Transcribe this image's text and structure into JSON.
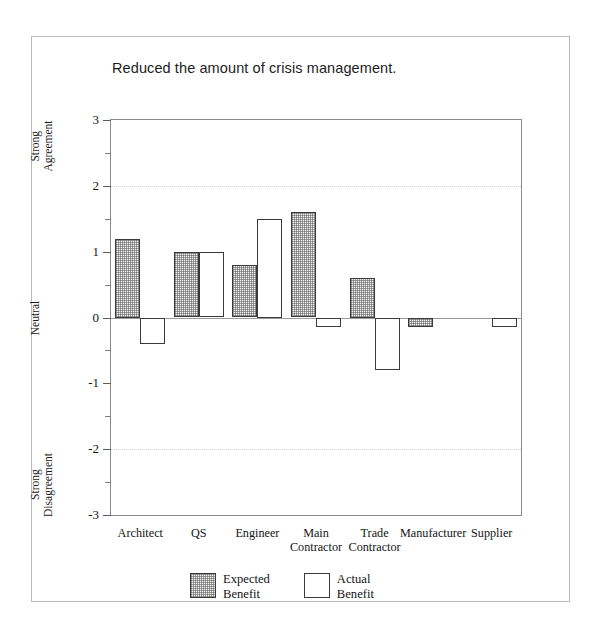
{
  "chart_data": {
    "type": "bar",
    "title": "Reduced the amount of crisis management.",
    "xlabel": "",
    "ylabel": "",
    "ylim": [
      -3,
      3
    ],
    "ytick_values": [
      3,
      2,
      1,
      0,
      -1,
      -2,
      -3
    ],
    "ytick_labels": [
      "3",
      "2",
      "1",
      "0",
      "-1",
      "-2",
      "-3"
    ],
    "yminor_step": 0.5,
    "grid": "horizontal dotted at 2 and -2, solid zero line at 0",
    "legend_position": "bottom-center",
    "axis_captions": [
      {
        "text": "Strong Agreement",
        "line1": "Strong",
        "line2": "Agreement",
        "at_value": 2.6
      },
      {
        "text": "Neutral",
        "line1": "Neutral",
        "line2": "",
        "at_value": 0
      },
      {
        "text": "Strong Disagreement",
        "line1": "Strong",
        "line2": "Disagreement",
        "at_value": -2.55
      }
    ],
    "categories": [
      "Architect",
      "QS",
      "Engineer",
      "Main Contractor",
      "Trade Contractor",
      "Manufacturer",
      "Supplier"
    ],
    "category_lines": [
      [
        "Architect",
        ""
      ],
      [
        "QS",
        ""
      ],
      [
        "Engineer",
        ""
      ],
      [
        "Main",
        "Contractor"
      ],
      [
        "Trade",
        "Contractor"
      ],
      [
        "Manufacturer",
        ""
      ],
      [
        "Supplier",
        ""
      ]
    ],
    "series": [
      {
        "name": "Expected Benefit",
        "key": "expected",
        "fill": "hatched",
        "values": [
          1.2,
          1.0,
          0.8,
          1.6,
          0.6,
          -0.15,
          null
        ]
      },
      {
        "name": "Actual Benefit",
        "key": "actual",
        "fill": "white",
        "values": [
          -0.4,
          1.0,
          1.5,
          -0.15,
          -0.8,
          null,
          -0.15
        ]
      }
    ]
  },
  "legend": {
    "items": [
      {
        "line1": "Expected",
        "line2": "Benefit",
        "style": "expected"
      },
      {
        "line1": "Actual",
        "line2": "Benefit",
        "style": "actual"
      }
    ]
  },
  "colors": {
    "frame": "#b9b9b9",
    "plot_border": "#8a8a8a",
    "bar_outline": "#3a3a3a",
    "gridline": "#d2d2d2",
    "zeroline": "#9a9a9a",
    "text": "#141414",
    "background": "#ffffff"
  }
}
